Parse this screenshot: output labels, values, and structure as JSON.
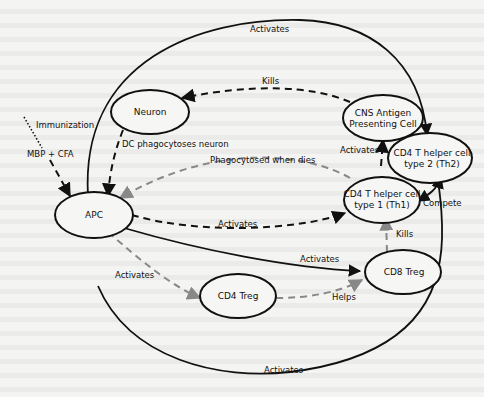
{
  "diagram": {
    "type": "immune-interaction-network",
    "nodes": {
      "neuron": {
        "label": "Neuron"
      },
      "cns_apc": {
        "label_line1": "CNS Antigen",
        "label_line2": "Presenting Cell"
      },
      "th2": {
        "label_line1": "CD4 T helper cell",
        "label_line2": "type 2 (Th2)"
      },
      "th1": {
        "label_line1": "CD4 T helper cell",
        "label_line2": "type 1 (Th1)"
      },
      "apc": {
        "label": "APC"
      },
      "cd4_treg": {
        "label": "CD4 Treg"
      },
      "cd8_treg": {
        "label": "CD8 Treg"
      }
    },
    "edges": {
      "immunization": {
        "label": "Immunization",
        "from": "external",
        "to": "apc",
        "style": "dotted"
      },
      "mbp_cfa": {
        "label": "MBP + CFA",
        "from": "external",
        "to": "apc",
        "style": "dashed"
      },
      "apc_th2_activates_top": {
        "label": "Activates",
        "from": "apc",
        "to": "th2",
        "style": "solid"
      },
      "cns_apc_kills_neuron": {
        "label": "Kills",
        "from": "cns_apc",
        "to": "neuron",
        "style": "dashed"
      },
      "dc_phagocytoses": {
        "label": "DC phagocytoses neuron",
        "from": "neuron",
        "to": "apc",
        "style": "dashed"
      },
      "phagocytosed_when_dies": {
        "label": "Phagocytosed when dies",
        "from": "th1",
        "to": "apc",
        "style": "dashed-gray"
      },
      "th1_activates_cns_apc": {
        "label": "Activates",
        "from": "th1",
        "to": "cns_apc",
        "style": "dashed"
      },
      "apc_activates_th1": {
        "label": "Activates",
        "from": "apc",
        "to": "th1",
        "style": "dashed"
      },
      "compete": {
        "label": "Compete",
        "from": "th1",
        "to": "th2",
        "style": "solid-bidirectional"
      },
      "cd8_kills_th1": {
        "label": "Kills",
        "from": "cd8_treg",
        "to": "th1",
        "style": "dashed-gray"
      },
      "apc_activates_cd8": {
        "label": "Activates",
        "from": "apc",
        "to": "cd8_treg",
        "style": "solid"
      },
      "apc_activates_cd4treg": {
        "label": "Activates",
        "from": "apc",
        "to": "cd4_treg",
        "style": "dashed-gray"
      },
      "cd4treg_helps_cd8": {
        "label": "Helps",
        "from": "cd4_treg",
        "to": "cd8_treg",
        "style": "dashed-gray"
      },
      "apc_th2_activates_bottom": {
        "label": "Activates",
        "from": "apc",
        "to": "th2",
        "style": "solid"
      }
    }
  }
}
